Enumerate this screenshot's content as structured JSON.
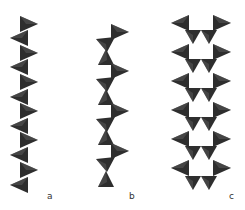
{
  "figure": {
    "tetra_color": "#2e2e2e",
    "tetra_highlight": "#5a5a5a",
    "background": "#ffffff"
  },
  "panels": [
    {
      "id": "a",
      "label": "a",
      "type": "single-chain",
      "tetrahedra": [
        {
          "x": 28,
          "y": 24,
          "dir": "right"
        },
        {
          "x": 20,
          "y": 38,
          "dir": "left"
        },
        {
          "x": 28,
          "y": 53,
          "dir": "right"
        },
        {
          "x": 20,
          "y": 67,
          "dir": "left"
        },
        {
          "x": 28,
          "y": 82,
          "dir": "right"
        },
        {
          "x": 20,
          "y": 97,
          "dir": "left"
        },
        {
          "x": 28,
          "y": 111,
          "dir": "right"
        },
        {
          "x": 20,
          "y": 126,
          "dir": "left"
        },
        {
          "x": 28,
          "y": 140,
          "dir": "right"
        },
        {
          "x": 20,
          "y": 155,
          "dir": "left"
        },
        {
          "x": 28,
          "y": 170,
          "dir": "right"
        },
        {
          "x": 20,
          "y": 185,
          "dir": "left"
        }
      ]
    },
    {
      "id": "b",
      "label": "b",
      "type": "zigzag-chain",
      "tetrahedra": [
        {
          "x": 119,
          "y": 32,
          "dir": "right"
        },
        {
          "x": 106,
          "y": 44,
          "dir": "down-left"
        },
        {
          "x": 106,
          "y": 58,
          "dir": "up"
        },
        {
          "x": 119,
          "y": 71,
          "dir": "right"
        },
        {
          "x": 106,
          "y": 84,
          "dir": "down-left"
        },
        {
          "x": 106,
          "y": 98,
          "dir": "up"
        },
        {
          "x": 119,
          "y": 111,
          "dir": "right"
        },
        {
          "x": 106,
          "y": 124,
          "dir": "down-left"
        },
        {
          "x": 106,
          "y": 138,
          "dir": "up"
        },
        {
          "x": 119,
          "y": 151,
          "dir": "right"
        },
        {
          "x": 106,
          "y": 164,
          "dir": "down-left"
        },
        {
          "x": 106,
          "y": 180,
          "dir": "up"
        }
      ]
    },
    {
      "id": "c",
      "label": "c",
      "type": "double-chain",
      "tetrahedra": [
        {
          "x": 181,
          "y": 23,
          "dir": "left"
        },
        {
          "x": 221,
          "y": 23,
          "dir": "right"
        },
        {
          "x": 193,
          "y": 36,
          "dir": "down"
        },
        {
          "x": 209,
          "y": 36,
          "dir": "down"
        },
        {
          "x": 181,
          "y": 52,
          "dir": "left"
        },
        {
          "x": 221,
          "y": 52,
          "dir": "right"
        },
        {
          "x": 193,
          "y": 65,
          "dir": "down"
        },
        {
          "x": 209,
          "y": 65,
          "dir": "down"
        },
        {
          "x": 181,
          "y": 81,
          "dir": "left"
        },
        {
          "x": 221,
          "y": 81,
          "dir": "right"
        },
        {
          "x": 193,
          "y": 94,
          "dir": "down"
        },
        {
          "x": 209,
          "y": 94,
          "dir": "down"
        },
        {
          "x": 181,
          "y": 110,
          "dir": "left"
        },
        {
          "x": 221,
          "y": 110,
          "dir": "right"
        },
        {
          "x": 193,
          "y": 123,
          "dir": "down"
        },
        {
          "x": 209,
          "y": 123,
          "dir": "down"
        },
        {
          "x": 181,
          "y": 139,
          "dir": "left"
        },
        {
          "x": 221,
          "y": 139,
          "dir": "right"
        },
        {
          "x": 193,
          "y": 152,
          "dir": "down"
        },
        {
          "x": 209,
          "y": 152,
          "dir": "down"
        },
        {
          "x": 181,
          "y": 168,
          "dir": "left"
        },
        {
          "x": 221,
          "y": 168,
          "dir": "right"
        },
        {
          "x": 193,
          "y": 182,
          "dir": "down"
        },
        {
          "x": 209,
          "y": 182,
          "dir": "down"
        }
      ]
    }
  ]
}
